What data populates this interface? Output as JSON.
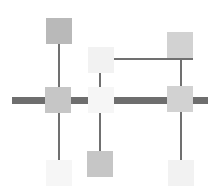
{
  "diagram": {
    "type": "grid-connector",
    "colors": {
      "background": "#ffffff",
      "main_bar": "#6e6e6e",
      "connector": "#707070",
      "node_dark": "#b9b9b9",
      "node_mid": "#c6c6c6",
      "node_light": "#d2d2d2",
      "node_pale": "#f2f2f2",
      "node_faint": "#f6f6f6"
    },
    "nodes": [
      {
        "id": "top-left",
        "row": "top",
        "column": 1,
        "shade": "node_dark"
      },
      {
        "id": "top-center",
        "row": "top",
        "column": 2,
        "shade": "node_pale"
      },
      {
        "id": "top-right",
        "row": "top",
        "column": 3,
        "shade": "node_light"
      },
      {
        "id": "middle-left",
        "row": "middle",
        "column": 1,
        "shade": "node_mid"
      },
      {
        "id": "middle-center",
        "row": "middle",
        "column": 2,
        "shade": "node_faint"
      },
      {
        "id": "middle-right",
        "row": "middle",
        "column": 3,
        "shade": "node_light"
      },
      {
        "id": "bottom-left",
        "row": "bottom",
        "column": 1,
        "shade": "node_faint"
      },
      {
        "id": "bottom-center",
        "row": "bottom",
        "column": 2,
        "shade": "node_mid"
      },
      {
        "id": "bottom-right",
        "row": "bottom",
        "column": 3,
        "shade": "node_pale"
      }
    ],
    "connections": [
      {
        "from": "top-left",
        "to": "middle-left"
      },
      {
        "from": "middle-left",
        "to": "bottom-left"
      },
      {
        "from": "top-center",
        "to": "middle-center"
      },
      {
        "from": "middle-center",
        "to": "bottom-center"
      },
      {
        "from": "top-center",
        "to": "top-right"
      },
      {
        "from": "top-right",
        "to": "middle-right"
      },
      {
        "from": "middle-right",
        "to": "bottom-right"
      }
    ],
    "main_bus": {
      "through": [
        "middle-left",
        "middle-center",
        "middle-right"
      ]
    }
  }
}
